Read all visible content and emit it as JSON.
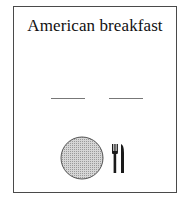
{
  "card": {
    "title": "American breakfast",
    "blanks": [
      {
        "name": "blank-1",
        "value": ""
      },
      {
        "name": "blank-2",
        "value": ""
      }
    ],
    "icons": [
      "plate-icon",
      "fork-icon",
      "knife-icon"
    ]
  },
  "colors": {
    "border": "#4a4a4a",
    "plate_fill": "#c8c8c8",
    "plate_stroke": "#555555",
    "cutlery": "#1a1a1a"
  }
}
